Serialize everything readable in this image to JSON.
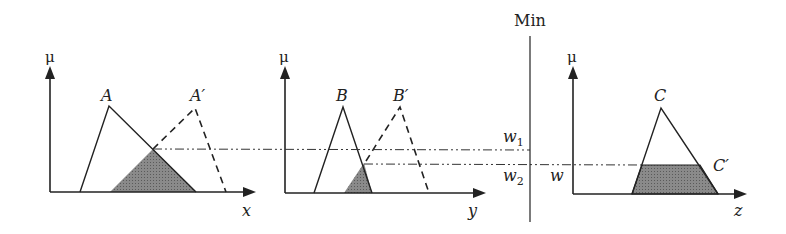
{
  "title_label": "Min",
  "colors": {
    "stroke": "#222222",
    "shade": "#7a7a7a",
    "background": "#ffffff"
  },
  "panels": [
    {
      "id": "x",
      "axis_y_label": "μ",
      "axis_x_label": "x",
      "set_label": "A",
      "input_label": "A′"
    },
    {
      "id": "y",
      "axis_y_label": "μ",
      "axis_x_label": "y",
      "set_label": "B",
      "input_label": "B′"
    },
    {
      "id": "z",
      "axis_y_label": "μ",
      "axis_x_label": "z",
      "set_label": "C",
      "output_label": "C′",
      "level_label": "w"
    }
  ],
  "levels": {
    "w1": "w",
    "w1_sub": "1",
    "w2": "w",
    "w2_sub": "2"
  }
}
